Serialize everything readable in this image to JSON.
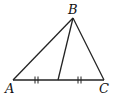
{
  "diagram": {
    "type": "triangle-with-median",
    "vertices": {
      "A": {
        "label": "A",
        "x": 13,
        "y": 80
      },
      "B": {
        "label": "B",
        "x": 73,
        "y": 18
      },
      "C": {
        "label": "C",
        "x": 104,
        "y": 80
      }
    },
    "median": {
      "from": "B",
      "to": "M",
      "M": {
        "x": 58,
        "y": 80
      }
    },
    "tick_marks": {
      "count_each": 2,
      "segments": [
        "AM",
        "MC"
      ]
    },
    "stroke_color": "#222222"
  }
}
